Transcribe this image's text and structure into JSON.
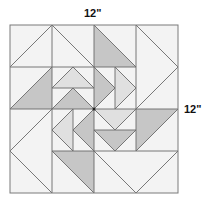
{
  "diagram": {
    "dimensions": {
      "width_label": "12\"",
      "height_label": "12\""
    },
    "grid": {
      "cols": 4,
      "rows": 4,
      "origin": [
        10,
        25
      ],
      "cell_size": 42
    },
    "colors": {
      "light": "#f3f3f3",
      "medium_light": "#e0e0e0",
      "dark": "#c6c6c6",
      "stroke": "#6a6a6a",
      "frame": "#7a7a7a"
    },
    "pieces": [
      {
        "name": "top-left-flying-geese",
        "fill": "light",
        "points": "10,67 52,25 94,67"
      },
      {
        "name": "top-left-flying-geese-bg-left",
        "fill": "light",
        "points": "10,25 52,25 10,67"
      },
      {
        "name": "top-left-flying-geese-bg-right",
        "fill": "light",
        "points": "52,25 94,25 94,67"
      },
      {
        "name": "top-mid-dark-triangle",
        "fill": "dark",
        "points": "94,25 136,67 94,67"
      },
      {
        "name": "top-mid-light-triangle",
        "fill": "light",
        "points": "94,25 136,25 136,67"
      },
      {
        "name": "right-vertical-geese",
        "fill": "light",
        "points": "136,25 178,67 136,109"
      },
      {
        "name": "right-vertical-bg-top",
        "fill": "light",
        "points": "136,25 178,25 178,67"
      },
      {
        "name": "right-vertical-bg-bottom",
        "fill": "light",
        "points": "178,67 178,109 136,109"
      },
      {
        "name": "row1-left-dark-triangle",
        "fill": "dark",
        "points": "10,109 52,67 52,109"
      },
      {
        "name": "row1-left-light-triangle",
        "fill": "light",
        "points": "10,67 52,67 10,109"
      },
      {
        "name": "center-top-light-geese",
        "fill": "medium_light",
        "points": "52,88 73,67 94,88"
      },
      {
        "name": "center-top-dark-geese",
        "fill": "dark",
        "points": "52,109 73,88 94,109"
      },
      {
        "name": "center-right-dark-geese",
        "fill": "dark",
        "points": "94,67 115,88 94,109"
      },
      {
        "name": "center-right-light-geese",
        "fill": "medium_light",
        "points": "115,67 136,88 115,109"
      },
      {
        "name": "center-left-light-geese",
        "fill": "medium_light",
        "points": "73,109 52,130 73,151"
      },
      {
        "name": "center-left-dark-geese",
        "fill": "dark",
        "points": "94,109 73,130 94,151"
      },
      {
        "name": "center-bottom-light-geese",
        "fill": "medium_light",
        "points": "94,109 136,109 115,130"
      },
      {
        "name": "center-bottom-dark-geese",
        "fill": "dark",
        "points": "94,130 136,130 115,151"
      },
      {
        "name": "row2-right-dark-triangle",
        "fill": "dark",
        "points": "136,109 178,109 136,151"
      },
      {
        "name": "left-vertical-geese",
        "fill": "light",
        "points": "52,109 10,151 52,193"
      },
      {
        "name": "row3-mid-dark-triangle",
        "fill": "dark",
        "points": "52,151 94,151 94,193"
      },
      {
        "name": "bottom-right-flying-geese",
        "fill": "light",
        "points": "94,151 178,151 136,193"
      }
    ],
    "lines": [
      "10,67 94,67",
      "94,67 136,67",
      "10,109 178,109",
      "52,151 178,151",
      "52,25 52,67",
      "94,25 94,193",
      "136,25 136,151",
      "52,67 52,193",
      "52,88 94,88",
      "115,67 115,109",
      "73,109 73,151",
      "94,130 136,130",
      "10,67 52,25",
      "52,25 94,67",
      "94,25 136,67",
      "136,25 178,67",
      "178,67 136,109",
      "10,109 52,67",
      "52,88 73,67",
      "73,67 94,88",
      "52,109 73,88",
      "73,88 94,109",
      "94,67 115,88",
      "115,88 94,109",
      "115,67 136,88",
      "136,88 115,109",
      "73,109 52,130",
      "52,130 73,151",
      "94,109 73,130",
      "73,130 94,151",
      "94,109 115,130",
      "115,130 136,109",
      "94,130 115,151",
      "115,151 136,130",
      "136,151 178,109",
      "52,109 10,151",
      "10,151 52,193",
      "52,151 94,193",
      "94,151 136,193",
      "136,193 178,151"
    ]
  }
}
